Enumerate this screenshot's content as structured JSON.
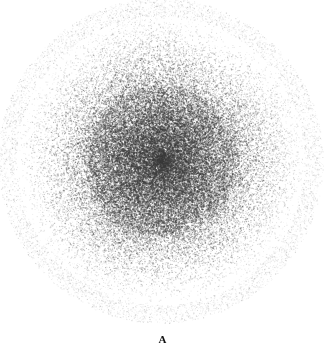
{
  "figure": {
    "panel_label": "A",
    "caption_text": "",
    "background_color": "#ffffff",
    "ink_color": "#4a4a4a",
    "core_color": "#7f7f7f",
    "label_color": "#111111"
  },
  "chart_data": {
    "type": "scatter",
    "title": "",
    "subtitle": "",
    "xlabel": "",
    "ylabel": "",
    "annotations": [
      "A"
    ],
    "legend": [],
    "grid": false,
    "axes_visible": false,
    "tick_labels_x": [],
    "tick_labels_y": [],
    "xlim": [
      0,
      327
    ],
    "ylim": [
      0,
      348
    ],
    "render": {
      "center_x": 161,
      "center_y": 161,
      "outer_radius": 152,
      "core_radius": 34,
      "point_count": 90000,
      "dot_size_min": 0.55,
      "dot_size_max": 1.35,
      "core_opacity": 0.72,
      "rim_opacity": 0.1,
      "falloff_exponent": 1.85,
      "seed": 20240917
    },
    "radial_profile": {
      "r_fraction": [
        0.0,
        0.1,
        0.2,
        0.3,
        0.4,
        0.5,
        0.6,
        0.7,
        0.8,
        0.9,
        1.0
      ],
      "mean_gray": [
        128,
        131,
        138,
        150,
        164,
        181,
        198,
        214,
        228,
        242,
        253
      ],
      "relative_density": [
        1.0,
        0.97,
        0.91,
        0.81,
        0.69,
        0.56,
        0.42,
        0.29,
        0.18,
        0.08,
        0.0
      ]
    }
  }
}
